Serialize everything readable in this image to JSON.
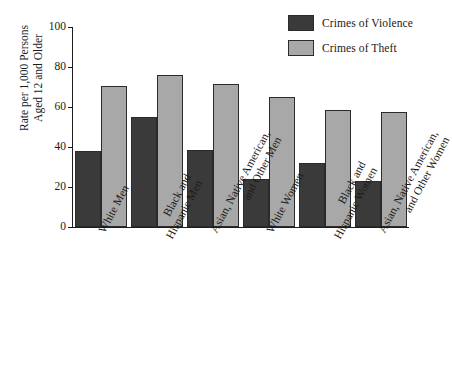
{
  "chart_data": {
    "type": "bar",
    "title": "",
    "subtitle": "",
    "xlabel": "",
    "ylabel": "Rate per 1,000 Persons Aged 12 and Older",
    "ylabel_lines": [
      "Rate per 1,000 Persons",
      "Aged 12 and Older"
    ],
    "ylim": [
      0,
      100
    ],
    "yticks": [
      0,
      20,
      40,
      60,
      80,
      100
    ],
    "ytick_labels": [
      "0",
      "20",
      "40",
      "60",
      "80",
      "100"
    ],
    "grid": false,
    "legend_position": "top-right",
    "categories": [
      "White Men",
      "Black and Hispanic Men",
      "Asian, Native American, and Other Men",
      "White Women",
      "Black and Hispanic Women",
      "Asian, Native American, and Other Women"
    ],
    "category_label_lines": [
      [
        "White Men"
      ],
      [
        "Black and",
        "Hispanic Men"
      ],
      [
        "Asian, Native American,",
        "and Other Men"
      ],
      [
        "White Women"
      ],
      [
        "Black and",
        "Hispanic Women"
      ],
      [
        "Asian, Native American,",
        "and Other Women"
      ]
    ],
    "series": [
      {
        "name": "Crimes of Violence",
        "color": "#3a3a3a",
        "values": [
          38,
          55,
          38.5,
          24,
          32,
          23
        ]
      },
      {
        "name": "Crimes of Theft",
        "color": "#a8a8a8",
        "values": [
          70.5,
          76,
          71.5,
          65,
          58.5,
          57.5
        ]
      }
    ],
    "colors": {
      "violence": "#3a3a3a",
      "theft": "#a8a8a8",
      "axis": "#1d1d1d",
      "bar_outline": "#2b2b2b",
      "background": "#ffffff"
    }
  }
}
